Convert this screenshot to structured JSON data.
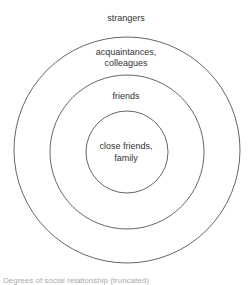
{
  "diagram": {
    "type": "concentric-circles",
    "rings": [
      {
        "label": "strangers"
      },
      {
        "label": "acquaintances,\ncolleagues"
      },
      {
        "label": "friends"
      },
      {
        "label": "close friends,\nfamily"
      }
    ],
    "labels": {
      "strangers": "strangers",
      "acquaintances_line1": "acquaintances,",
      "acquaintances_line2": "colleagues",
      "friends": "friends",
      "close_line1": "close friends,",
      "close_line2": "family"
    },
    "caption": "Degrees of social relationship (truncated)",
    "stroke_color": "#666666"
  }
}
